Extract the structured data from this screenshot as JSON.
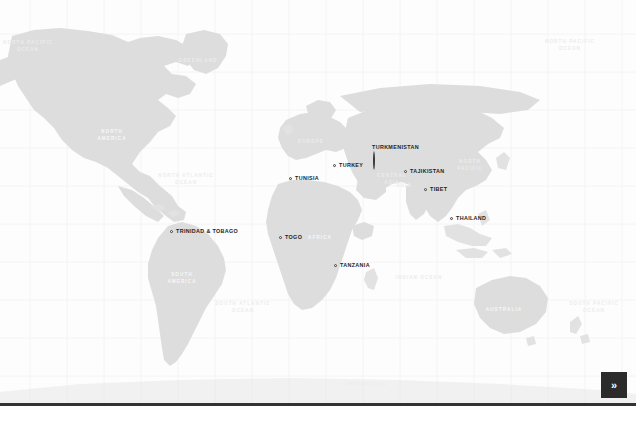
{
  "map": {
    "title": "World Map",
    "projection": "equirectangular",
    "land_color": "#dddddd",
    "ocean_color": "#fdfdfd",
    "graticule_color": "#f1f1f1",
    "marker_color": "#3a3a3a",
    "label_color": "#1d1d1d",
    "markers": [
      {
        "name": "Trinidad & Tobago",
        "label": "TRINIDAD &\nTOBAGO",
        "x": 170,
        "y": 232,
        "anchor": "right"
      },
      {
        "name": "Tunisia",
        "label": "TUNISIA",
        "x": 289,
        "y": 179,
        "anchor": "right"
      },
      {
        "name": "Togo",
        "label": "TOGO",
        "x": 279,
        "y": 238,
        "anchor": "right"
      },
      {
        "name": "Tanzania",
        "label": "TANZANIA",
        "x": 334,
        "y": 266,
        "anchor": "right"
      },
      {
        "name": "Turkey",
        "label": "TURKEY",
        "x": 333,
        "y": 166,
        "anchor": "right"
      },
      {
        "name": "Turkmenistan",
        "label": "TURKMENISTAN",
        "x": 372,
        "y": 167,
        "anchor": "above"
      },
      {
        "name": "Tajikistan",
        "label": "TAJIKISTAN",
        "x": 404,
        "y": 172,
        "anchor": "right"
      },
      {
        "name": "Tibet",
        "label": "TIBET",
        "x": 424,
        "y": 190,
        "anchor": "right"
      },
      {
        "name": "Thailand",
        "label": "THAILAND",
        "x": 450,
        "y": 219,
        "anchor": "right"
      }
    ],
    "regions": [
      {
        "name": "north-pacific-ocean",
        "label": "NORTH PACIFIC\nOCEAN",
        "x": 28,
        "y": 47,
        "kind": "ocean"
      },
      {
        "name": "greenland",
        "label": "GREENLAND",
        "x": 198,
        "y": 61,
        "kind": "ocean"
      },
      {
        "name": "north-atlantic-ocean",
        "label": "NORTH ATLANTIC\nOCEAN",
        "x": 186,
        "y": 180,
        "kind": "ocean"
      },
      {
        "name": "north-america",
        "label": "NORTH\nAMERICA",
        "x": 112,
        "y": 136,
        "kind": "continent"
      },
      {
        "name": "europe",
        "label": "EUROPE",
        "x": 311,
        "y": 142,
        "kind": "ocean"
      },
      {
        "name": "asia",
        "label": "ASIA",
        "x": 404,
        "y": 186,
        "kind": "ocean"
      },
      {
        "name": "central-asia",
        "label": "CENTRAL\nASIA",
        "x": 392,
        "y": 180,
        "kind": "ocean"
      },
      {
        "name": "north-pacific-ocean-east",
        "label": "NORTH\nPACIFIC",
        "x": 470,
        "y": 166,
        "kind": "ocean"
      },
      {
        "name": "north-pacific-ocean-far",
        "label": "NORTH PACIFIC\nOCEAN",
        "x": 570,
        "y": 46,
        "kind": "ocean"
      },
      {
        "name": "africa",
        "label": "AFRICA",
        "x": 320,
        "y": 238,
        "kind": "continent"
      },
      {
        "name": "south-america",
        "label": "SOUTH\nAMERICA",
        "x": 182,
        "y": 279,
        "kind": "continent"
      },
      {
        "name": "south-atlantic-ocean",
        "label": "SOUTH ATLANTIC\nOCEAN",
        "x": 243,
        "y": 308,
        "kind": "ocean"
      },
      {
        "name": "indian-ocean",
        "label": "INDIAN OCEAN",
        "x": 419,
        "y": 278,
        "kind": "ocean"
      },
      {
        "name": "australia",
        "label": "AUSTRALIA",
        "x": 504,
        "y": 310,
        "kind": "continent"
      },
      {
        "name": "south-pacific-ocean",
        "label": "SOUTH PACIFIC\nOCEAN",
        "x": 594,
        "y": 308,
        "kind": "ocean"
      },
      {
        "name": "antarctica",
        "label": "ANTARCTICA",
        "x": 366,
        "y": 385,
        "kind": "ocean"
      }
    ]
  },
  "controls": {
    "next_label": "»",
    "next_icon": "double-chevron-right-icon"
  }
}
